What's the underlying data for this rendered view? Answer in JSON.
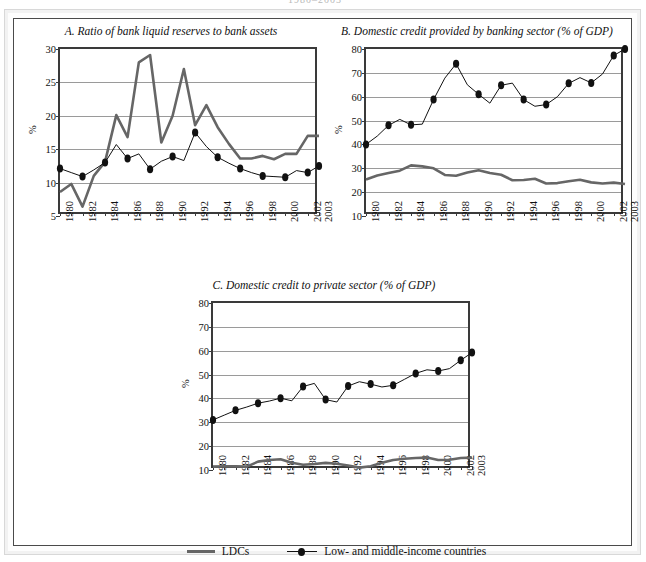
{
  "page": {
    "top_fragment": "1980–2003",
    "outer_border_color": "#d8d8d8",
    "inner_border_color": "#4a4a4a"
  },
  "legend": {
    "items": [
      {
        "label": "LDCs",
        "style": "thick-line",
        "color": "#666666"
      },
      {
        "label": "Low- and middle-income countries",
        "style": "line-with-markers",
        "color": "#111111"
      }
    ]
  },
  "chart_data": [
    {
      "id": "A",
      "type": "line",
      "title": "A. Ratio of bank liquid reserves to bank assets",
      "xlabel": "",
      "ylabel": "%",
      "ylim": [
        5,
        30
      ],
      "yticks": [
        5,
        10,
        15,
        20,
        25,
        30
      ],
      "grid": true,
      "legend_position": "bottom-shared",
      "x": [
        1980,
        1981,
        1982,
        1983,
        1984,
        1985,
        1986,
        1987,
        1988,
        1989,
        1990,
        1991,
        1992,
        1993,
        1994,
        1995,
        1996,
        1997,
        1998,
        1999,
        2000,
        2001,
        2002,
        2003
      ],
      "tick_labels": [
        "1980",
        "",
        "1982",
        "",
        "1984",
        "",
        "1986",
        "",
        "1988",
        "",
        "1990",
        "",
        "1992",
        "",
        "1994",
        "",
        "1996",
        "",
        "1998",
        "",
        "2000",
        "",
        "2002",
        "2003"
      ],
      "series": [
        {
          "name": "LDCs",
          "color": "#666666",
          "markers": false,
          "values": [
            8.6,
            9.8,
            6.4,
            11.0,
            13.1,
            20.1,
            16.8,
            28.0,
            29.1,
            16.0,
            20.0,
            27.0,
            18.6,
            21.6,
            18.3,
            15.8,
            13.6,
            13.6,
            14.0,
            13.5,
            14.3,
            14.3,
            17.0,
            17.0
          ]
        },
        {
          "name": "Low- and middle-income countries",
          "color": "#111111",
          "markers": true,
          "values": [
            12.1,
            11.5,
            10.9,
            11.9,
            13.0,
            15.7,
            13.6,
            14.3,
            12.0,
            13.2,
            13.9,
            13.3,
            17.5,
            15.4,
            13.8,
            12.9,
            12.1,
            11.5,
            11.0,
            10.9,
            10.8,
            11.8,
            11.5,
            12.5
          ]
        }
      ]
    },
    {
      "id": "B",
      "type": "line",
      "title": "B. Domestic credit provided by banking sector (% of GDP)",
      "xlabel": "",
      "ylabel": "%",
      "ylim": [
        10,
        80
      ],
      "yticks": [
        10,
        20,
        30,
        40,
        50,
        60,
        70,
        80
      ],
      "grid": true,
      "legend_position": "bottom-shared",
      "x": [
        1980,
        1981,
        1982,
        1983,
        1984,
        1985,
        1986,
        1987,
        1988,
        1989,
        1990,
        1991,
        1992,
        1993,
        1994,
        1995,
        1996,
        1997,
        1998,
        1999,
        2000,
        2001,
        2002,
        2003
      ],
      "tick_labels": [
        "1980",
        "",
        "1982",
        "",
        "1984",
        "",
        "1986",
        "",
        "1988",
        "",
        "1990",
        "",
        "1992",
        "",
        "1994",
        "",
        "1996",
        "",
        "1998",
        "",
        "2000",
        "",
        "2002",
        "2003"
      ],
      "series": [
        {
          "name": "LDCs",
          "color": "#666666",
          "markers": false,
          "values": [
            25.3,
            27.0,
            28.0,
            29.0,
            31.2,
            30.8,
            30.0,
            27.2,
            26.9,
            28.2,
            29.2,
            28.0,
            27.3,
            25.0,
            25.1,
            25.6,
            23.6,
            23.8,
            24.6,
            25.2,
            24.1,
            23.6,
            24.0,
            23.4
          ]
        },
        {
          "name": "Low- and middle-income countries",
          "color": "#111111",
          "markers": true,
          "values": [
            40.0,
            43.5,
            48.0,
            50.5,
            48.2,
            48.5,
            58.8,
            67.8,
            73.8,
            65.0,
            61.0,
            57.3,
            64.8,
            65.7,
            58.8,
            56.0,
            56.7,
            60.0,
            65.6,
            68.0,
            65.8,
            69.5,
            77.3,
            80.0
          ]
        }
      ]
    },
    {
      "id": "C",
      "type": "line",
      "title": "C. Domestic credit to private sector (% of GDP)",
      "xlabel": "",
      "ylabel": "%",
      "ylim": [
        10,
        80
      ],
      "yticks": [
        10,
        20,
        30,
        40,
        50,
        60,
        70,
        80
      ],
      "grid": true,
      "legend_position": "bottom-shared",
      "x": [
        1980,
        1981,
        1982,
        1983,
        1984,
        1985,
        1986,
        1987,
        1988,
        1989,
        1990,
        1991,
        1992,
        1993,
        1994,
        1995,
        1996,
        1997,
        1998,
        1999,
        2000,
        2001,
        2002,
        2003
      ],
      "tick_labels": [
        "1980",
        "",
        "1982",
        "",
        "1984",
        "",
        "1986",
        "",
        "1988",
        "",
        "1990",
        "",
        "1992",
        "",
        "1994",
        "",
        "1996",
        "",
        "1998",
        "",
        "2000",
        "",
        "2002",
        "2003"
      ],
      "series": [
        {
          "name": "LDCs",
          "color": "#666666",
          "markers": false,
          "values": [
            11.4,
            11.5,
            11.5,
            11.4,
            13.5,
            14.2,
            14.5,
            13.0,
            12.2,
            12.5,
            13.0,
            12.6,
            11.9,
            11.0,
            11.6,
            13.0,
            14.2,
            14.7,
            15.0,
            15.2,
            14.2,
            14.3,
            15.0,
            15.2
          ]
        },
        {
          "name": "Low- and middle-income countries",
          "color": "#111111",
          "markers": true,
          "values": [
            31.0,
            33.0,
            35.0,
            36.4,
            38.0,
            38.9,
            40.1,
            39.0,
            45.0,
            46.3,
            39.5,
            38.5,
            45.2,
            47.0,
            46.0,
            44.8,
            45.5,
            48.0,
            50.5,
            52.0,
            51.5,
            52.5,
            56.0,
            59.2
          ]
        }
      ]
    }
  ]
}
